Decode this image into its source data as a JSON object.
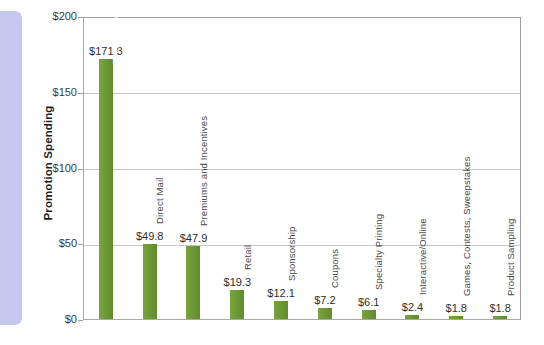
{
  "chart_data": {
    "type": "bar",
    "title": "",
    "xlabel": "",
    "ylabel": "Promotion Spending",
    "ylim": [
      0,
      200
    ],
    "ytick_labels": [
      "$0",
      "$50",
      "$100",
      "$150",
      "$200"
    ],
    "ytick_values": [
      0,
      50,
      100,
      150,
      200
    ],
    "grid": true,
    "legend": "none",
    "bar_color": "#6f9b37",
    "panel_color": "#c5c8ee",
    "categories": [
      "Event Marketing",
      "Direct Mail",
      "Premiums and Incentives",
      "Retail",
      "Sponsorship",
      "Coupons",
      "Specialty Printing",
      "Interactive/Online",
      "Games, Contests, Sweepstakes",
      "Product Sampling"
    ],
    "values": [
      171.8,
      49.8,
      47.9,
      19.3,
      12.1,
      7.2,
      6.1,
      2.4,
      1.8,
      1.8
    ],
    "value_labels": [
      "$171.8",
      "$49.8",
      "$47.9",
      "$19.3",
      "$12.1",
      "$7.2",
      "$6.1",
      "$2.4",
      "$1.8",
      "$1.8"
    ],
    "label_placement": [
      "inside",
      "outside",
      "outside",
      "outside",
      "outside",
      "outside",
      "outside",
      "outside",
      "outside",
      "outside"
    ]
  }
}
